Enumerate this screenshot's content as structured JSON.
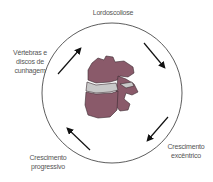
{
  "diagram": {
    "labels": {
      "top": "Lordoscoliose",
      "left_line1": "Vértebras e",
      "left_line2": "discos de",
      "left_line3": "cunhagem",
      "bottom_left_line1": "Crescimento",
      "bottom_left_line2": "progressivo",
      "bottom_right_line1": "Crescimento",
      "bottom_right_line2": "excêntrico"
    },
    "colors": {
      "vertebra": "#8a5a6a",
      "disc": "#c8c8c8",
      "circle": "#333333",
      "arrow": "#111111"
    }
  }
}
